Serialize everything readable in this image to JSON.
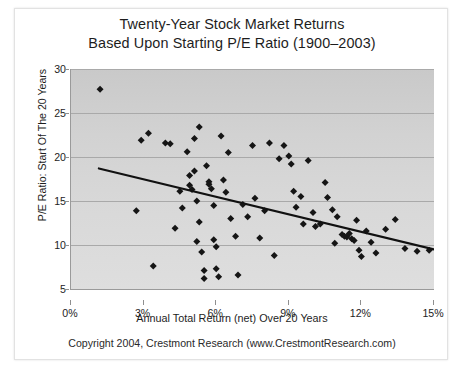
{
  "chart_data": {
    "type": "scatter",
    "title": "Twenty-Year Stock Market Returns",
    "subtitle": "Based Upon Starting P/E Ratio (1900–2003)",
    "xlabel": "Annual Total Return (net) Over 20 Years",
    "ylabel": "P/E Ratio: Start Of The 20 Years",
    "xlim": [
      0,
      15
    ],
    "ylim": [
      5,
      30
    ],
    "xticks": [
      0,
      3,
      6,
      9,
      12,
      15
    ],
    "xtick_labels": [
      "0%",
      "3%",
      "6%",
      "9%",
      "12%",
      "15%"
    ],
    "yticks": [
      5,
      10,
      15,
      20,
      25,
      30
    ],
    "ytick_labels": [
      "5",
      "10",
      "15",
      "20",
      "25",
      "30"
    ],
    "grid": "horizontal",
    "legend": "none",
    "plot_background": "#d5d5d5",
    "marker": "diamond",
    "marker_color": "#151515",
    "trendline": {
      "label": "linear fit",
      "color": "#111111",
      "x_start": 1.15,
      "y_start": 18.7,
      "x_end": 15.0,
      "y_end": 9.5
    },
    "series": [
      {
        "name": "Starting P/E vs 20-Year Return",
        "points": [
          [
            1.2,
            27.7
          ],
          [
            2.7,
            13.9
          ],
          [
            2.9,
            21.9
          ],
          [
            3.2,
            22.7
          ],
          [
            3.4,
            7.6
          ],
          [
            3.9,
            21.6
          ],
          [
            4.1,
            21.5
          ],
          [
            4.3,
            11.9
          ],
          [
            4.5,
            16.1
          ],
          [
            4.6,
            14.2
          ],
          [
            4.8,
            20.6
          ],
          [
            4.9,
            17.9
          ],
          [
            4.9,
            16.8
          ],
          [
            5.0,
            16.3
          ],
          [
            5.1,
            22.1
          ],
          [
            5.1,
            18.4
          ],
          [
            5.2,
            15.0
          ],
          [
            5.2,
            10.4
          ],
          [
            5.3,
            23.4
          ],
          [
            5.3,
            12.6
          ],
          [
            5.4,
            9.2
          ],
          [
            5.5,
            7.1
          ],
          [
            5.5,
            6.2
          ],
          [
            5.6,
            19.0
          ],
          [
            5.7,
            17.2
          ],
          [
            5.7,
            16.9
          ],
          [
            5.8,
            16.4
          ],
          [
            5.9,
            14.5
          ],
          [
            5.9,
            10.6
          ],
          [
            6.0,
            9.8
          ],
          [
            6.0,
            7.3
          ],
          [
            6.1,
            6.4
          ],
          [
            6.2,
            22.4
          ],
          [
            6.3,
            17.4
          ],
          [
            6.4,
            16.0
          ],
          [
            6.5,
            20.5
          ],
          [
            6.6,
            13.0
          ],
          [
            6.8,
            11.0
          ],
          [
            6.9,
            6.6
          ],
          [
            7.1,
            14.6
          ],
          [
            7.3,
            13.2
          ],
          [
            7.5,
            21.3
          ],
          [
            7.6,
            15.3
          ],
          [
            7.8,
            10.8
          ],
          [
            8.0,
            13.9
          ],
          [
            8.2,
            21.6
          ],
          [
            8.4,
            8.8
          ],
          [
            8.6,
            19.8
          ],
          [
            8.8,
            21.3
          ],
          [
            9.0,
            20.1
          ],
          [
            9.1,
            19.2
          ],
          [
            9.2,
            16.1
          ],
          [
            9.3,
            14.3
          ],
          [
            9.5,
            15.5
          ],
          [
            9.6,
            12.4
          ],
          [
            9.8,
            19.6
          ],
          [
            10.0,
            13.7
          ],
          [
            10.1,
            12.1
          ],
          [
            10.3,
            12.4
          ],
          [
            10.5,
            17.1
          ],
          [
            10.6,
            15.4
          ],
          [
            10.8,
            14.0
          ],
          [
            10.9,
            10.2
          ],
          [
            11.0,
            13.2
          ],
          [
            11.2,
            11.2
          ],
          [
            11.3,
            11.0
          ],
          [
            11.4,
            10.9
          ],
          [
            11.5,
            11.3
          ],
          [
            11.6,
            10.7
          ],
          [
            11.7,
            10.5
          ],
          [
            11.8,
            12.8
          ],
          [
            11.9,
            9.4
          ],
          [
            12.0,
            8.7
          ],
          [
            12.2,
            11.6
          ],
          [
            12.4,
            10.3
          ],
          [
            12.6,
            9.1
          ],
          [
            13.0,
            11.8
          ],
          [
            13.4,
            12.9
          ],
          [
            13.8,
            9.6
          ],
          [
            14.3,
            9.3
          ],
          [
            14.8,
            9.4
          ]
        ]
      }
    ]
  },
  "footer": {
    "copyright": "Copyright 2004, Crestmont Research (www.CrestmontResearch.com)"
  }
}
